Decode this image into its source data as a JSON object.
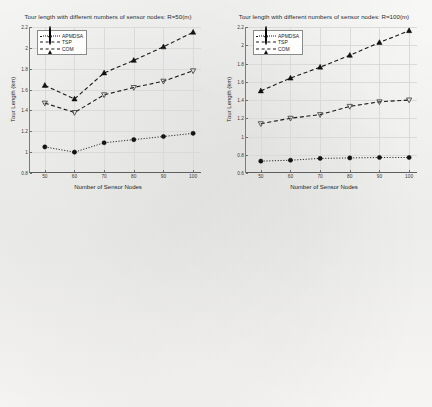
{
  "figure": {
    "background": "#fbfbfa",
    "series_color": "#1a1a1a",
    "grid_color": "#dadad6"
  },
  "legend": {
    "entries": [
      {
        "label": "APMDSA",
        "marker": "circle",
        "line": "dotted"
      },
      {
        "label": "TSP",
        "marker": "triangle-up",
        "line": "dashed"
      },
      {
        "label": "COM",
        "marker": "triangle-down",
        "line": "dashed"
      }
    ]
  },
  "chart_data": [
    {
      "id": "tour-length-r50",
      "type": "line",
      "title": "Tour length with different numbers of sensor nodes: R=50(m)",
      "xlabel": "Number of Sensor Nodes",
      "ylabel": "Tour Length (km)",
      "x": [
        50,
        60,
        70,
        80,
        90,
        100
      ],
      "xlim": [
        45,
        103
      ],
      "ylim": [
        0.8,
        2.2
      ],
      "yticks": [
        0.8,
        1,
        1.2,
        1.4,
        1.6,
        1.8,
        2,
        2.2
      ],
      "ytick_labels": [
        "0.8",
        "1",
        "1.2",
        "1.4",
        "1.6",
        "1.8",
        "2",
        "2.2"
      ],
      "xticks": [
        50,
        60,
        70,
        80,
        90,
        100
      ],
      "xtick_labels": [
        "50",
        "60",
        "70",
        "80",
        "90",
        "100"
      ],
      "grid": true,
      "legend_position": "upper-left",
      "series": [
        {
          "name": "APMDSA",
          "marker": "circle",
          "line": "dotted",
          "values": [
            1.05,
            1.0,
            1.09,
            1.12,
            1.15,
            1.18
          ]
        },
        {
          "name": "TSP",
          "marker": "triangle-up",
          "line": "dashed",
          "values": [
            1.64,
            1.51,
            1.76,
            1.88,
            2.01,
            2.15
          ]
        },
        {
          "name": "COM",
          "marker": "triangle-down",
          "line": "dashed",
          "values": [
            1.47,
            1.38,
            1.55,
            1.62,
            1.68,
            1.78
          ]
        }
      ]
    },
    {
      "id": "tour-length-r100",
      "type": "line",
      "title": "Tour length with different numbers of sensor nodes: R=100(m)",
      "xlabel": "Number of Sensor Nodes",
      "ylabel": "Tour Length (km)",
      "x": [
        50,
        60,
        70,
        80,
        90,
        100
      ],
      "xlim": [
        45,
        103
      ],
      "ylim": [
        0.6,
        2.2
      ],
      "yticks": [
        0.6,
        0.8,
        1,
        1.2,
        1.4,
        1.6,
        1.8,
        2,
        2.2
      ],
      "ytick_labels": [
        "0.6",
        "0.8",
        "1",
        "1.2",
        "1.4",
        "1.6",
        "1.8",
        "2",
        "2.2"
      ],
      "xticks": [
        50,
        60,
        70,
        80,
        90,
        100
      ],
      "xtick_labels": [
        "50",
        "60",
        "70",
        "80",
        "90",
        "100"
      ],
      "grid": true,
      "legend_position": "upper-left",
      "series": [
        {
          "name": "APMDSA",
          "marker": "circle",
          "line": "dotted",
          "values": [
            0.73,
            0.74,
            0.76,
            0.765,
            0.77,
            0.77
          ]
        },
        {
          "name": "TSP",
          "marker": "triangle-up",
          "line": "dashed",
          "values": [
            1.5,
            1.64,
            1.76,
            1.89,
            2.03,
            2.16
          ]
        },
        {
          "name": "COM",
          "marker": "triangle-down",
          "line": "dashed",
          "values": [
            1.14,
            1.2,
            1.24,
            1.33,
            1.38,
            1.4
          ]
        }
      ]
    },
    {
      "id": "run-time-r50",
      "type": "line",
      "title": "Tour length with different numbers of sensor nodes: R=50(m)",
      "title_suffix": "25",
      "xlabel": "Number of Sensor Nodes",
      "ylabel": "Run Time (s)",
      "x": [
        50,
        60,
        70,
        80,
        90,
        100
      ],
      "xlim": [
        45,
        103
      ],
      "ylim": [
        0,
        23
      ],
      "yticks": [
        0,
        5,
        10,
        15,
        20
      ],
      "ytick_labels": [
        "0",
        "5",
        "10",
        "15",
        "20"
      ],
      "xticks": [
        50,
        60,
        70,
        80,
        90,
        100
      ],
      "xtick_labels": [
        "50",
        "60",
        "70",
        "80",
        "90",
        "100"
      ],
      "grid": true,
      "legend_position": "upper-left",
      "series": [
        {
          "name": "APMDSA",
          "marker": "circle",
          "line": "dotted",
          "values": [
            0.7,
            0.7,
            0.7,
            1.1,
            1.1,
            1.2
          ]
        },
        {
          "name": "TSP",
          "marker": "triangle-up",
          "line": "dashed",
          "values": [
            8.0,
            10.0,
            13.3,
            20.2,
            20.0,
            22.0
          ]
        },
        {
          "name": "COM",
          "marker": "triangle-down",
          "line": "dashed",
          "values": [
            0.6,
            0.6,
            0.6,
            1.0,
            1.0,
            1.1
          ]
        }
      ]
    },
    {
      "id": "run-time-r100",
      "type": "line",
      "title": "Tour length with different numbers of sensor nodes: R=100(m)",
      "title_suffix": "20",
      "xlabel": "Number of Sensor Nodes",
      "ylabel": "Run Time (s)",
      "x": [
        50,
        60,
        70,
        80,
        90,
        100
      ],
      "xlim": [
        45,
        103
      ],
      "ylim": [
        0,
        19.5
      ],
      "yticks": [
        0,
        2,
        4,
        6,
        8,
        10,
        12,
        14,
        16,
        18
      ],
      "ytick_labels": [
        "0",
        "2",
        "4",
        "6",
        "8",
        "10",
        "12",
        "14",
        "16",
        "18"
      ],
      "xticks": [
        50,
        60,
        70,
        80,
        90,
        100
      ],
      "xtick_labels": [
        "50",
        "60",
        "70",
        "80",
        "90",
        "100"
      ],
      "grid": true,
      "legend_position": "upper-left",
      "series": [
        {
          "name": "APMDSA",
          "marker": "circle",
          "line": "dotted",
          "values": [
            0.5,
            0.5,
            0.5,
            0.6,
            0.6,
            0.65
          ]
        },
        {
          "name": "TSP",
          "marker": "triangle-up",
          "line": "dashed",
          "values": [
            7.4,
            10.4,
            14.4,
            15.2,
            16.8,
            18.5
          ]
        },
        {
          "name": "COM",
          "marker": "triangle-down",
          "line": "dashed",
          "values": [
            7.3,
            10.3,
            14.3,
            15.1,
            16.7,
            18.4
          ]
        }
      ]
    }
  ]
}
